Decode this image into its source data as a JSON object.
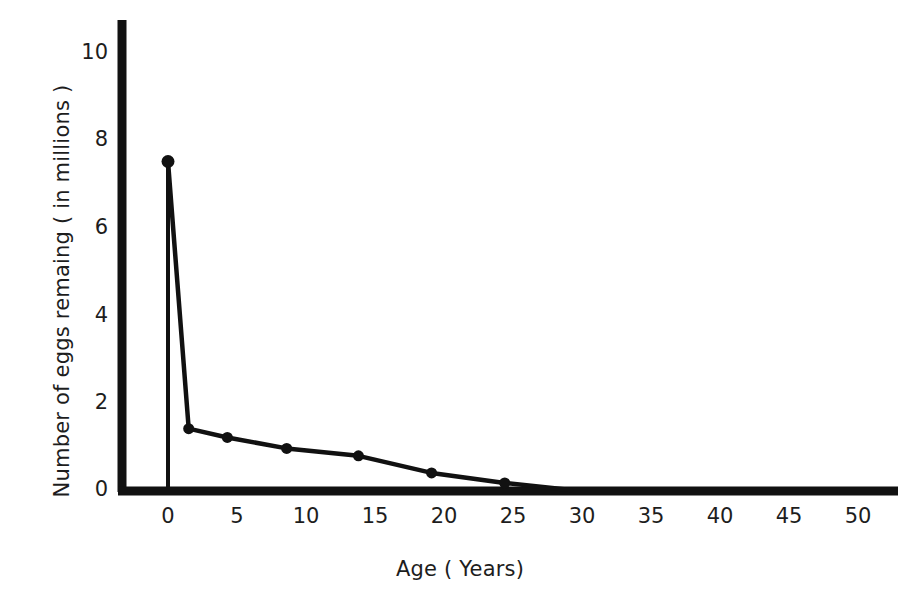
{
  "chart_data": {
    "type": "line",
    "title": "",
    "xlabel": "Age ( Years)",
    "ylabel": "Number of eggs remaing ( in millions )",
    "xlim": [
      -1.2,
      52
    ],
    "ylim": [
      -0.35,
      10.9
    ],
    "xticks": [
      "0",
      "5",
      "10",
      "15",
      "20",
      "25",
      "30",
      "35",
      "40",
      "45",
      "50"
    ],
    "xtick_values": [
      0,
      5,
      10,
      15,
      20,
      25,
      30,
      35,
      40,
      45,
      50
    ],
    "yticks": [
      "0",
      "2",
      "4",
      "6",
      "8",
      "10"
    ],
    "ytick_values": [
      0,
      2,
      4,
      6,
      8,
      10
    ],
    "grid": false,
    "legend": null,
    "marker": "filled-circle",
    "line_color": "#111111",
    "x": [
      0,
      1.5,
      4.3,
      8.6,
      13.8,
      19.1,
      24.4,
      29.2
    ],
    "values": [
      7.5,
      1.4,
      1.2,
      0.95,
      0.78,
      0.39,
      0.16,
      0.0
    ],
    "series": [
      {
        "name": "Number of eggs remaining",
        "points": [
          {
            "x": 0,
            "y": 7.5
          },
          {
            "x": 1.5,
            "y": 1.4
          },
          {
            "x": 4.3,
            "y": 1.2
          },
          {
            "x": 8.6,
            "y": 0.95
          },
          {
            "x": 13.8,
            "y": 0.78
          },
          {
            "x": 19.1,
            "y": 0.39
          },
          {
            "x": 24.4,
            "y": 0.16
          },
          {
            "x": 29.2,
            "y": 0.0
          }
        ]
      }
    ],
    "annotations": [
      {
        "name": "drop-line-at-origin",
        "description": "vertical stem from first data point down to x-axis at age 0"
      }
    ]
  },
  "axes": {
    "y_axis_name": "value-axis",
    "x_axis_name": "category-axis"
  }
}
